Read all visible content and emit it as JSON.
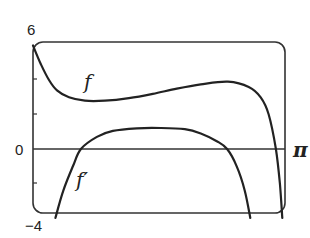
{
  "chart_data": {
    "type": "line",
    "title": "",
    "xlabel": "",
    "ylabel": "",
    "xlim": [
      0,
      3.14159
    ],
    "ylim": [
      -4,
      6
    ],
    "grid": false,
    "legend": "none (curves labeled inline)",
    "x_tick_labels": [
      "π"
    ],
    "y_tick_labels": [
      "6",
      "0",
      "−4"
    ],
    "y_ticks": [
      6,
      4,
      2,
      0,
      -2,
      -4
    ],
    "annotations": [
      "f",
      "f′"
    ],
    "series": [
      {
        "name": "f",
        "points": [
          [
            0.0,
            6.0
          ],
          [
            0.1,
            4.9
          ],
          [
            0.2,
            4.0
          ],
          [
            0.3,
            3.4
          ],
          [
            0.45,
            3.0
          ],
          [
            0.65,
            2.8
          ],
          [
            0.9,
            2.8
          ],
          [
            1.2,
            2.95
          ],
          [
            1.5,
            3.2
          ],
          [
            1.8,
            3.5
          ],
          [
            2.1,
            3.75
          ],
          [
            2.44,
            3.9
          ],
          [
            2.7,
            3.6
          ],
          [
            2.85,
            3.0
          ],
          [
            2.95,
            2.0
          ],
          [
            3.04,
            0.0
          ],
          [
            3.09,
            -2.0
          ],
          [
            3.12,
            -4.0
          ]
        ]
      },
      {
        "name": "f′",
        "points": [
          [
            0.28,
            -4.0
          ],
          [
            0.38,
            -2.4
          ],
          [
            0.5,
            -1.0
          ],
          [
            0.6,
            0.0
          ],
          [
            0.8,
            0.7
          ],
          [
            1.0,
            1.05
          ],
          [
            1.3,
            1.2
          ],
          [
            1.6,
            1.22
          ],
          [
            1.9,
            1.15
          ],
          [
            2.1,
            0.9
          ],
          [
            2.3,
            0.45
          ],
          [
            2.43,
            0.0
          ],
          [
            2.55,
            -1.0
          ],
          [
            2.65,
            -2.4
          ],
          [
            2.72,
            -4.0
          ]
        ]
      }
    ]
  },
  "labels": {
    "y_top": "6",
    "y_zero": "0",
    "y_bottom": "−4",
    "x_right": "π",
    "f_label": "f",
    "fprime_label": "f′"
  },
  "colors": {
    "stroke": "#222222",
    "background": "#ffffff"
  }
}
